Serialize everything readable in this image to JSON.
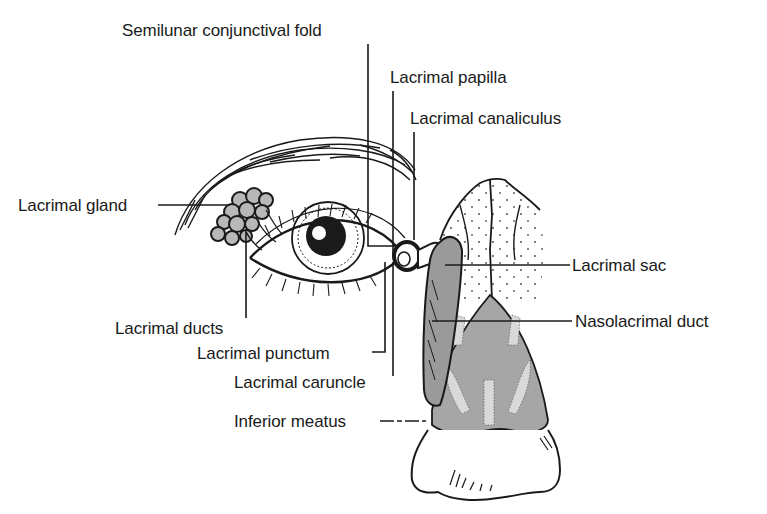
{
  "figure": {
    "colors": {
      "ink": "#1a1a1a",
      "gland_fill": "#b8b8b8",
      "duct_fill": "#9a9a9a",
      "sac_fill": "#a6a6a6",
      "highlight": "#d9d9d9",
      "background": "#ffffff"
    }
  },
  "labels": {
    "semilunar_fold": "Semilunar conjunctival fold",
    "lacrimal_papilla": "Lacrimal papilla",
    "lacrimal_canaliculus": "Lacrimal canaliculus",
    "lacrimal_gland": "Lacrimal gland",
    "lacrimal_sac": "Lacrimal sac",
    "nasolacrimal_duct": "Nasolacrimal duct",
    "lacrimal_ducts": "Lacrimal ducts",
    "lacrimal_punctum": "Lacrimal punctum",
    "lacrimal_caruncle": "Lacrimal caruncle",
    "inferior_meatus": "Inferior meatus"
  }
}
